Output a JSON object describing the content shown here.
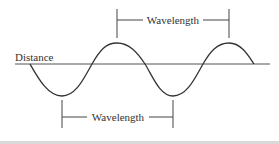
{
  "diagram": {
    "axis_label": "Distance",
    "top_bracket_label": "Wavelength",
    "bottom_bracket_label": "Wavelength",
    "colors": {
      "line": "#333333",
      "background": "#ffffff",
      "bottom_rule": "#d9d9d9"
    },
    "wave": {
      "cycles_shown": 1.75,
      "peaks_x": [
        117,
        229
      ],
      "troughs_x": [
        62,
        173
      ]
    }
  }
}
